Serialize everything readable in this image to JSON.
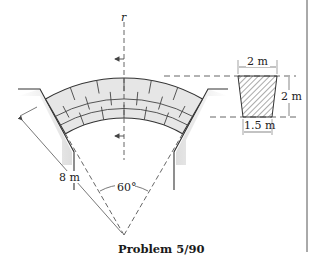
{
  "figure": {
    "caption": "Problem 5/90",
    "axis_label": "r",
    "labels": {
      "radius": "8 m",
      "angle": "60°",
      "section_top_width": "2 m",
      "section_height": "2 m",
      "section_bottom_width": "1.5 m"
    },
    "geometry": {
      "arch_center": [
        124,
        235
      ],
      "outer_radius_px": 157,
      "inner_radius_px": 117,
      "half_angle_deg": 30
    },
    "colors": {
      "line": "#333333",
      "stone_fill": "#e4e4e4",
      "pier_shade": "#cfcfcf",
      "dash": "#555555"
    }
  }
}
